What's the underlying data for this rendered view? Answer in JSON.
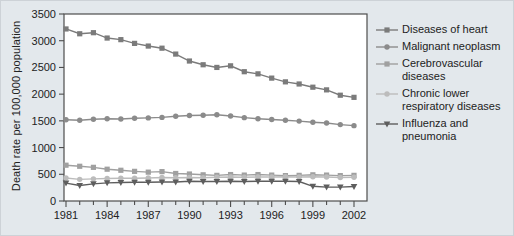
{
  "panel": {
    "background": "#e3e8ec",
    "plot_background": "#ffffff",
    "axis_color": "#4d4d4d",
    "text_color": "#222222"
  },
  "chart_data": {
    "type": "line",
    "title": "",
    "xlabel": "",
    "ylabel": "Death rate per 100,000 population",
    "ylim": [
      0,
      3500
    ],
    "yticks": [
      0,
      500,
      1000,
      1500,
      2000,
      2500,
      3000,
      3500
    ],
    "x": [
      1981,
      1982,
      1983,
      1984,
      1985,
      1986,
      1987,
      1988,
      1989,
      1990,
      1991,
      1992,
      1993,
      1994,
      1995,
      1996,
      1997,
      1998,
      1999,
      2000,
      2001,
      2002
    ],
    "labeled_xticks": [
      1981,
      1984,
      1987,
      1990,
      1993,
      1996,
      1999,
      2002
    ],
    "grid": false,
    "legend_position": "right",
    "series": [
      {
        "name": "Diseases of heart",
        "marker": "square",
        "color": "#7b7b7b",
        "values": [
          3220,
          3130,
          3150,
          3050,
          3020,
          2950,
          2900,
          2860,
          2750,
          2620,
          2550,
          2500,
          2530,
          2420,
          2380,
          2300,
          2230,
          2190,
          2130,
          2080,
          1980,
          1940
        ]
      },
      {
        "name": "Malignant neoplasm",
        "marker": "circle",
        "color": "#8b8b8b",
        "values": [
          1520,
          1510,
          1530,
          1540,
          1535,
          1550,
          1555,
          1565,
          1585,
          1600,
          1605,
          1615,
          1590,
          1560,
          1540,
          1525,
          1510,
          1495,
          1475,
          1460,
          1430,
          1410
        ]
      },
      {
        "name": "Cerebrovascular diseases",
        "marker": "square",
        "color": "#a0a0a0",
        "values": [
          670,
          650,
          630,
          595,
          575,
          555,
          540,
          550,
          515,
          505,
          490,
          480,
          495,
          485,
          495,
          485,
          475,
          480,
          490,
          485,
          475,
          480
        ]
      },
      {
        "name": "Chronic lower respiratory diseases",
        "marker": "circle",
        "color": "#bcbcbc",
        "values": [
          430,
          405,
          415,
          420,
          425,
          425,
          430,
          440,
          435,
          440,
          435,
          445,
          450,
          445,
          450,
          450,
          455,
          450,
          455,
          450,
          440,
          445
        ]
      },
      {
        "name": "Influenza and pneumonia",
        "marker": "triangle-down",
        "color": "#5e5e5e",
        "values": [
          335,
          290,
          320,
          340,
          345,
          350,
          350,
          355,
          355,
          370,
          365,
          365,
          370,
          365,
          370,
          370,
          370,
          365,
          275,
          260,
          260,
          270
        ]
      }
    ]
  }
}
